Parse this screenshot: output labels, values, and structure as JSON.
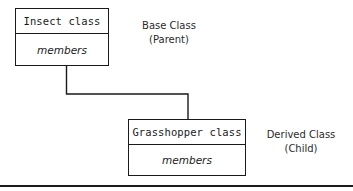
{
  "diagram": {
    "stroke_color": "#1a1a1a",
    "text_color": "#2b2b2b",
    "background_color": "#ffffff",
    "base_class": {
      "name": "Insect class",
      "members": "members",
      "annotation_line1": "Base Class",
      "annotation_line2": "(Parent)"
    },
    "derived_class": {
      "name": "Grasshopper class",
      "members": "members",
      "annotation_line1": "Derived Class",
      "annotation_line2": "(Child)"
    },
    "connector": {
      "type": "orthogonal-step",
      "from": "base-class-box-bottom",
      "to": "derived-class-box-top"
    }
  }
}
